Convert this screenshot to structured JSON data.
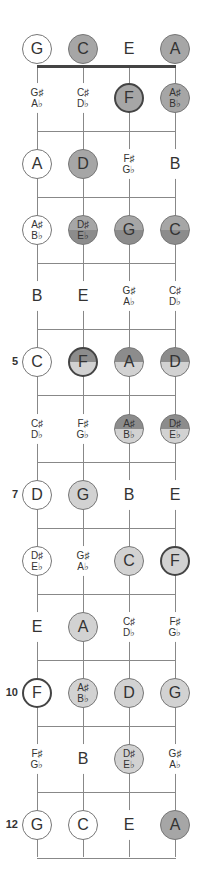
{
  "diagram": {
    "strings": [
      "G",
      "C",
      "E",
      "A"
    ],
    "colors": {
      "dark": "#8c8c8c",
      "mid": "#a6a6a6",
      "light": "#d2d2d2",
      "outline": "#777777",
      "bold_outline": "#444444"
    },
    "fret_markers": [
      {
        "fret": 5,
        "label": "5"
      },
      {
        "fret": 7,
        "label": "7"
      },
      {
        "fret": 10,
        "label": "10"
      },
      {
        "fret": 12,
        "label": "12"
      }
    ],
    "rows": [
      {
        "fret": 0,
        "notes": [
          {
            "label": [
              "G"
            ],
            "style": "outline",
            "fill": "none"
          },
          {
            "label": [
              "C"
            ],
            "style": "thin",
            "fill": "mid"
          },
          {
            "label": [
              "E"
            ],
            "style": "nocircle",
            "fill": "none"
          },
          {
            "label": [
              "A"
            ],
            "style": "thin",
            "fill": "mid"
          }
        ]
      },
      {
        "fret": 1,
        "notes": [
          {
            "label": [
              "G♯",
              "A♭"
            ],
            "style": "nocircle",
            "fill": "none"
          },
          {
            "label": [
              "C♯",
              "D♭"
            ],
            "style": "nocircle",
            "fill": "none"
          },
          {
            "label": [
              "F"
            ],
            "style": "bold",
            "fill": "mid"
          },
          {
            "label": [
              "A♯",
              "B♭"
            ],
            "style": "thin",
            "fill": "mid"
          }
        ]
      },
      {
        "fret": 2,
        "notes": [
          {
            "label": [
              "A"
            ],
            "style": "outline",
            "fill": "none"
          },
          {
            "label": [
              "D"
            ],
            "style": "thin",
            "fill": "mid"
          },
          {
            "label": [
              "F♯",
              "G♭"
            ],
            "style": "nocircle",
            "fill": "none"
          },
          {
            "label": [
              "B"
            ],
            "style": "nocircle",
            "fill": "none"
          }
        ]
      },
      {
        "fret": 3,
        "notes": [
          {
            "label": [
              "A♯",
              "B♭"
            ],
            "style": "outline",
            "fill": "none"
          },
          {
            "label": [
              "D♯",
              "E♭"
            ],
            "style": "thin",
            "fill": "split-mid-dark"
          },
          {
            "label": [
              "G"
            ],
            "style": "thin",
            "fill": "split-mid-dark"
          },
          {
            "label": [
              "C"
            ],
            "style": "thin",
            "fill": "split-mid-dark"
          }
        ]
      },
      {
        "fret": 4,
        "notes": [
          {
            "label": [
              "B"
            ],
            "style": "nocircle",
            "fill": "none"
          },
          {
            "label": [
              "E"
            ],
            "style": "nocircle",
            "fill": "none"
          },
          {
            "label": [
              "G♯",
              "A♭"
            ],
            "style": "nocircle",
            "fill": "none"
          },
          {
            "label": [
              "C♯",
              "D♭"
            ],
            "style": "nocircle",
            "fill": "none"
          }
        ]
      },
      {
        "fret": 5,
        "notes": [
          {
            "label": [
              "C"
            ],
            "style": "outline",
            "fill": "none"
          },
          {
            "label": [
              "F"
            ],
            "style": "bold",
            "fill": "split-dark-light"
          },
          {
            "label": [
              "A"
            ],
            "style": "thin",
            "fill": "split-dark-light"
          },
          {
            "label": [
              "D"
            ],
            "style": "thin",
            "fill": "split-dark-light"
          }
        ]
      },
      {
        "fret": 6,
        "notes": [
          {
            "label": [
              "C♯",
              "D♭"
            ],
            "style": "nocircle",
            "fill": "none"
          },
          {
            "label": [
              "F♯",
              "G♭"
            ],
            "style": "nocircle",
            "fill": "none"
          },
          {
            "label": [
              "A♯",
              "B♭"
            ],
            "style": "thin",
            "fill": "split-dark-light"
          },
          {
            "label": [
              "D♯",
              "E♭"
            ],
            "style": "thin",
            "fill": "split-dark-light"
          }
        ]
      },
      {
        "fret": 7,
        "notes": [
          {
            "label": [
              "D"
            ],
            "style": "outline",
            "fill": "none"
          },
          {
            "label": [
              "G"
            ],
            "style": "thin",
            "fill": "light"
          },
          {
            "label": [
              "B"
            ],
            "style": "nocircle",
            "fill": "none"
          },
          {
            "label": [
              "E"
            ],
            "style": "nocircle",
            "fill": "none"
          }
        ]
      },
      {
        "fret": 8,
        "notes": [
          {
            "label": [
              "D♯",
              "E♭"
            ],
            "style": "outline",
            "fill": "none"
          },
          {
            "label": [
              "G♯",
              "A♭"
            ],
            "style": "nocircle",
            "fill": "none"
          },
          {
            "label": [
              "C"
            ],
            "style": "thin",
            "fill": "light"
          },
          {
            "label": [
              "F"
            ],
            "style": "bold",
            "fill": "light"
          }
        ]
      },
      {
        "fret": 9,
        "notes": [
          {
            "label": [
              "E"
            ],
            "style": "nocircle",
            "fill": "none"
          },
          {
            "label": [
              "A"
            ],
            "style": "thin",
            "fill": "light"
          },
          {
            "label": [
              "C♯",
              "D♭"
            ],
            "style": "nocircle",
            "fill": "none"
          },
          {
            "label": [
              "F♯",
              "G♭"
            ],
            "style": "nocircle",
            "fill": "none"
          }
        ]
      },
      {
        "fret": 10,
        "notes": [
          {
            "label": [
              "F"
            ],
            "style": "bold",
            "fill": "none"
          },
          {
            "label": [
              "A♯",
              "B♭"
            ],
            "style": "thin",
            "fill": "light"
          },
          {
            "label": [
              "D"
            ],
            "style": "thin",
            "fill": "light"
          },
          {
            "label": [
              "G"
            ],
            "style": "thin",
            "fill": "light"
          }
        ]
      },
      {
        "fret": 11,
        "notes": [
          {
            "label": [
              "F♯",
              "G♭"
            ],
            "style": "nocircle",
            "fill": "none"
          },
          {
            "label": [
              "B"
            ],
            "style": "nocircle",
            "fill": "none"
          },
          {
            "label": [
              "D♯",
              "E♭"
            ],
            "style": "thin",
            "fill": "light"
          },
          {
            "label": [
              "G♯",
              "A♭"
            ],
            "style": "nocircle",
            "fill": "none"
          }
        ]
      },
      {
        "fret": 12,
        "notes": [
          {
            "label": [
              "G"
            ],
            "style": "outline",
            "fill": "none"
          },
          {
            "label": [
              "C"
            ],
            "style": "outline",
            "fill": "none"
          },
          {
            "label": [
              "E"
            ],
            "style": "nocircle",
            "fill": "none"
          },
          {
            "label": [
              "A"
            ],
            "style": "thin",
            "fill": "mid"
          }
        ]
      }
    ]
  }
}
